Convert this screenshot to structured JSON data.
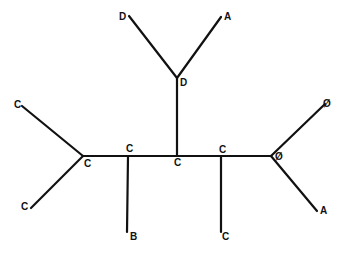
{
  "diagram": {
    "type": "unrooted-tree",
    "colors": {
      "line": "#111111",
      "background": "#ffffff"
    },
    "nodes": [
      {
        "id": "n_left",
        "x": 83,
        "y": 156,
        "label": "C",
        "lx": 84,
        "ly": 167
      },
      {
        "id": "n_b",
        "x": 128,
        "y": 156,
        "label": "C",
        "lx": 126,
        "ly": 152
      },
      {
        "id": "n_mid",
        "x": 177,
        "y": 156,
        "label": "C",
        "lx": 174,
        "ly": 166
      },
      {
        "id": "n_c2",
        "x": 221,
        "y": 156,
        "label": "C",
        "lx": 219,
        "ly": 153
      },
      {
        "id": "n_right",
        "x": 271,
        "y": 156,
        "label": "Ø",
        "lx": 275,
        "ly": 160
      },
      {
        "id": "n_top",
        "x": 177,
        "y": 78,
        "label": "D",
        "lx": 180,
        "ly": 86
      },
      {
        "id": "leaf_c_ul",
        "x": 22,
        "y": 106,
        "label": "C",
        "lx": 14,
        "ly": 108
      },
      {
        "id": "leaf_c_ll",
        "x": 31,
        "y": 208,
        "label": "C",
        "lx": 21,
        "ly": 210
      },
      {
        "id": "leaf_b",
        "x": 127,
        "y": 232,
        "label": "B",
        "lx": 130,
        "ly": 240
      },
      {
        "id": "leaf_d",
        "x": 129,
        "y": 16,
        "label": "D",
        "lx": 119,
        "ly": 20
      },
      {
        "id": "leaf_a_t",
        "x": 221,
        "y": 17,
        "label": "A",
        "lx": 224,
        "ly": 20
      },
      {
        "id": "leaf_c_b",
        "x": 221,
        "y": 232,
        "label": "C",
        "lx": 222,
        "ly": 240
      },
      {
        "id": "leaf_o",
        "x": 325,
        "y": 104,
        "label": "Ø",
        "lx": 323,
        "ly": 107
      },
      {
        "id": "leaf_a_r",
        "x": 317,
        "y": 211,
        "label": "A",
        "lx": 320,
        "ly": 214
      }
    ],
    "edges": [
      [
        "leaf_c_ul",
        "n_left"
      ],
      [
        "leaf_c_ll",
        "n_left"
      ],
      [
        "n_left",
        "n_b"
      ],
      [
        "n_b",
        "n_mid"
      ],
      [
        "n_mid",
        "n_c2"
      ],
      [
        "n_c2",
        "n_right"
      ],
      [
        "n_b",
        "leaf_b"
      ],
      [
        "n_mid",
        "n_top"
      ],
      [
        "n_top",
        "leaf_d"
      ],
      [
        "n_top",
        "leaf_a_t"
      ],
      [
        "n_c2",
        "leaf_c_b"
      ],
      [
        "n_right",
        "leaf_o"
      ],
      [
        "n_right",
        "leaf_a_r"
      ]
    ]
  }
}
